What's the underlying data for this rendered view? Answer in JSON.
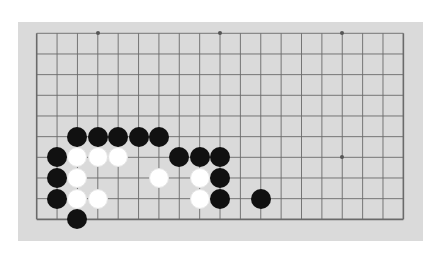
{
  "board": {
    "size": 19,
    "visible_columns": 19,
    "visible_rows": 10,
    "origin_px": {
      "x": 36.7,
      "y": 33.3
    },
    "spacing_px": {
      "x": 20.37,
      "y": 20.67
    },
    "colors": {
      "board": "#dadada",
      "line": "#6a6a6a",
      "black": "#111111",
      "white": "#ffffff"
    },
    "star_points": [
      {
        "col": 3,
        "row": 0
      },
      {
        "col": 9,
        "row": 0
      },
      {
        "col": 15,
        "row": 0
      },
      {
        "col": 15,
        "row": 6
      }
    ],
    "stones": {
      "black": [
        {
          "col": 2,
          "row": 5
        },
        {
          "col": 3,
          "row": 5
        },
        {
          "col": 4,
          "row": 5
        },
        {
          "col": 5,
          "row": 5
        },
        {
          "col": 6,
          "row": 5
        },
        {
          "col": 1,
          "row": 6
        },
        {
          "col": 7,
          "row": 6
        },
        {
          "col": 8,
          "row": 6
        },
        {
          "col": 9,
          "row": 6
        },
        {
          "col": 1,
          "row": 7
        },
        {
          "col": 9,
          "row": 7
        },
        {
          "col": 1,
          "row": 8
        },
        {
          "col": 9,
          "row": 8
        },
        {
          "col": 11,
          "row": 8
        },
        {
          "col": 2,
          "row": 9
        }
      ],
      "white": [
        {
          "col": 2,
          "row": 6
        },
        {
          "col": 3,
          "row": 6
        },
        {
          "col": 4,
          "row": 6
        },
        {
          "col": 2,
          "row": 7
        },
        {
          "col": 6,
          "row": 7
        },
        {
          "col": 8,
          "row": 7
        },
        {
          "col": 2,
          "row": 8
        },
        {
          "col": 3,
          "row": 8
        },
        {
          "col": 8,
          "row": 8
        }
      ]
    }
  }
}
